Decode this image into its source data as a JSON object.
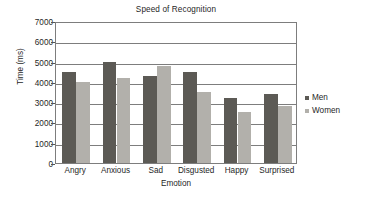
{
  "chart_data": {
    "type": "bar",
    "title": "Speed of Recognition",
    "xlabel": "Emotion",
    "ylabel": "Time (ms)",
    "categories": [
      "Angry",
      "Anxious",
      "Sad",
      "Disgusted",
      "Happy",
      "Surprised"
    ],
    "series": [
      {
        "name": "Men",
        "color": "#5c5a55",
        "values": [
          4500,
          5000,
          4300,
          4500,
          3200,
          3400
        ]
      },
      {
        "name": "Women",
        "color": "#b2b0ab",
        "values": [
          4000,
          4200,
          4800,
          3500,
          2500,
          2800
        ]
      }
    ],
    "ylim": [
      0,
      7000
    ],
    "ytick_labels": [
      "7000",
      "6000",
      "5000",
      "4000",
      "3000",
      "2000",
      "1000",
      "0"
    ],
    "ytick_values": [
      7000,
      6000,
      5000,
      4000,
      3000,
      2000,
      1000,
      0
    ],
    "grid": true,
    "legend_position": "right",
    "plot_border_color": "#7d7d7d",
    "background": "#ffffff"
  },
  "legend": {
    "entries": [
      {
        "label": "Men"
      },
      {
        "label": "Women"
      }
    ]
  }
}
